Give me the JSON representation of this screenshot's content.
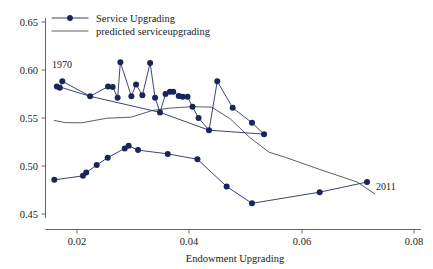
{
  "chart_data": {
    "type": "scatter",
    "title": "",
    "xlabel": "Endowment Upgrading",
    "ylabel": "",
    "xlim": [
      0.0134,
      0.0816
    ],
    "ylim": [
      0.4384,
      0.6616
    ],
    "xticks": [
      0.02,
      0.04,
      0.06,
      0.08
    ],
    "xtick_labels": [
      "0.02",
      "0.04",
      "0.06",
      "0.08"
    ],
    "yticks": [
      0.45,
      0.5,
      0.55,
      0.6,
      0.65
    ],
    "ytick_labels": [
      "0.45",
      "0.50",
      "0.55",
      "0.60",
      "0.65"
    ],
    "grid": false,
    "legend_position": "top-left",
    "annotations": [
      {
        "text": "1970",
        "x": 0.0156,
        "y": 0.6005
      },
      {
        "text": "2011",
        "x": 0.0735,
        "y": 0.4885
      }
    ],
    "series": [
      {
        "name": "Service Upgrading",
        "type": "scatter-line",
        "color": "#1b2559",
        "marker": "circle",
        "points": [
          [
            0.01545,
            0.5892
          ],
          [
            0.016,
            0.588
          ],
          [
            0.01645,
            0.5948
          ],
          [
            0.0215,
            0.579
          ],
          [
            0.02475,
            0.5892
          ],
          [
            0.0256,
            0.5888
          ],
          [
            0.0265,
            0.5775
          ],
          [
            0.027,
            0.6148
          ],
          [
            0.029,
            0.579
          ],
          [
            0.02985,
            0.5915
          ],
          [
            0.031,
            0.58
          ],
          [
            0.0324,
            0.6142
          ],
          [
            0.0333,
            0.5775
          ],
          [
            0.0342,
            0.562
          ],
          [
            0.0352,
            0.5815
          ],
          [
            0.036,
            0.5838
          ],
          [
            0.0366,
            0.5838
          ],
          [
            0.0376,
            0.5793
          ],
          [
            0.0383,
            0.5785
          ],
          [
            0.0392,
            0.5785
          ],
          [
            0.0401,
            0.568
          ],
          [
            0.0412,
            0.556
          ],
          [
            0.0431,
            0.5432
          ],
          [
            0.0446,
            0.5948
          ],
          [
            0.0474,
            0.5668
          ],
          [
            0.0509,
            0.551
          ],
          [
            0.0531,
            0.539
          ]
        ]
      },
      {
        "name": "Service Upgrading lower branch",
        "type": "scatter-line",
        "color": "#1b2559",
        "marker": "circle",
        "points": [
          [
            0.015,
            0.4908
          ],
          [
            0.0202,
            0.495
          ],
          [
            0.0208,
            0.4985
          ],
          [
            0.0227,
            0.5065
          ],
          [
            0.0247,
            0.5142
          ],
          [
            0.0278,
            0.524
          ],
          [
            0.0285,
            0.5268
          ],
          [
            0.0302,
            0.5222
          ],
          [
            0.0356,
            0.5182
          ],
          [
            0.041,
            0.5125
          ],
          [
            0.0463,
            0.4838
          ],
          [
            0.0509,
            0.466
          ],
          [
            0.0632,
            0.4778
          ],
          [
            0.0718,
            0.4885
          ]
        ]
      },
      {
        "name": "predicted serviceupgrading",
        "type": "line",
        "color": "#4a4a55",
        "points": [
          [
            0.015,
            0.5535
          ],
          [
            0.017,
            0.5512
          ],
          [
            0.02,
            0.551
          ],
          [
            0.0245,
            0.5558
          ],
          [
            0.029,
            0.557
          ],
          [
            0.0328,
            0.564
          ],
          [
            0.036,
            0.5665
          ],
          [
            0.04,
            0.568
          ],
          [
            0.0436,
            0.5675
          ],
          [
            0.047,
            0.555
          ],
          [
            0.0505,
            0.5355
          ],
          [
            0.054,
            0.52
          ],
          [
            0.057,
            0.5145
          ],
          [
            0.063,
            0.5022
          ],
          [
            0.07,
            0.4885
          ],
          [
            0.0732,
            0.476
          ]
        ]
      },
      {
        "name": "observed connector descending",
        "type": "line",
        "color": "#1b2559",
        "points": [
          [
            0.01645,
            0.588
          ],
          [
            0.0215,
            0.579
          ],
          [
            0.0342,
            0.562
          ],
          [
            0.0431,
            0.5432
          ],
          [
            0.0531,
            0.539
          ]
        ]
      }
    ],
    "legend": [
      {
        "label": "Service Upgrading",
        "marker": "circle-line",
        "color": "#1b2559"
      },
      {
        "label": "predicted serviceupgrading",
        "marker": "line",
        "color": "#4a4a55"
      }
    ]
  },
  "axes": {
    "x_title": "Endowment Upgrading",
    "x_tick_labels": [
      "0.02",
      "0.04",
      "0.06",
      "0.08"
    ],
    "y_tick_labels": [
      "0.45",
      "0.50",
      "0.55",
      "0.60",
      "0.65"
    ]
  },
  "legend": {
    "series_label": "Service Upgrading",
    "predicted_label": "predicted serviceupgrading"
  },
  "annotations": {
    "start_year": "1970",
    "end_year": "2011"
  },
  "colors": {
    "series": "#1b2559",
    "predicted": "#4a4a55",
    "axis": "#555555",
    "text": "#1a1a1a",
    "background": "#ffffff"
  }
}
